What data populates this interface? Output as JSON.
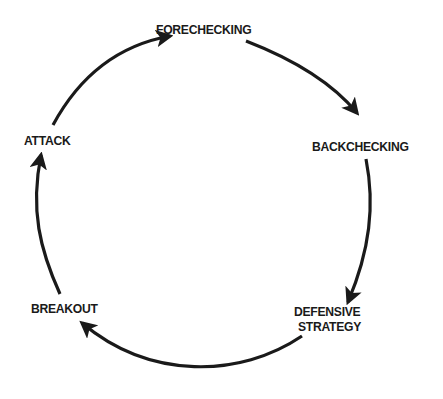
{
  "diagram": {
    "type": "cycle",
    "direction": "clockwise",
    "stroke_color": "#1a1a1a",
    "background": "#ffffff",
    "nodes": [
      {
        "id": "forechecking",
        "label": "FORECHECKING"
      },
      {
        "id": "backchecking",
        "label": "BACKCHECKING"
      },
      {
        "id": "defensive-strategy",
        "line1": "DEFENSIVE",
        "line2": "STRATEGY"
      },
      {
        "id": "breakout",
        "label": "BREAKOUT"
      },
      {
        "id": "attack",
        "label": "ATTACK"
      }
    ],
    "edges": [
      {
        "from": "FORECHECKING",
        "to": "BACKCHECKING"
      },
      {
        "from": "BACKCHECKING",
        "to": "DEFENSIVE STRATEGY"
      },
      {
        "from": "DEFENSIVE STRATEGY",
        "to": "BREAKOUT"
      },
      {
        "from": "BREAKOUT",
        "to": "ATTACK"
      },
      {
        "from": "ATTACK",
        "to": "FORECHECKING"
      }
    ]
  }
}
